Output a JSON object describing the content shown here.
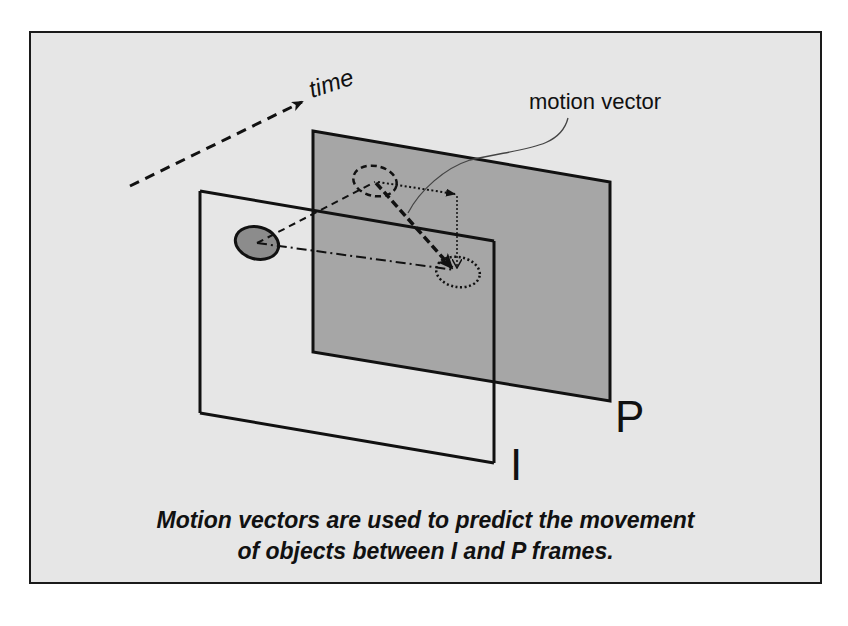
{
  "diagram": {
    "labels": {
      "time": "time",
      "motion_vector": "motion vector",
      "i_frame": "I",
      "p_frame": "P"
    },
    "caption": {
      "line1": "Motion vectors are used to predict the movement",
      "line2": "of objects between I and P frames."
    },
    "colors": {
      "background": "#e6e6e6",
      "p_frame_fill": "#a6a6a6",
      "object_fill": "#8c8c8c",
      "stroke": "#111111"
    }
  }
}
